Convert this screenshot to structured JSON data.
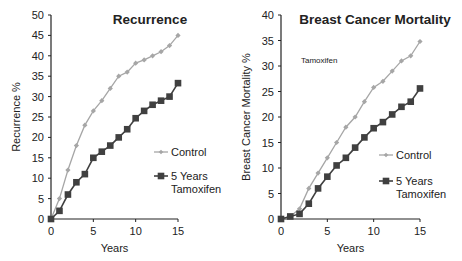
{
  "colors": {
    "control": "#a6a6a6",
    "tamoxifen": "#404040",
    "axis": "#222222"
  },
  "chart_data": [
    {
      "type": "line",
      "title": "Recurrence",
      "xlabel": "Years",
      "ylabel": "Recurrence %",
      "xlim": [
        0,
        15
      ],
      "ylim": [
        0,
        50
      ],
      "xticks": [
        0,
        5,
        10,
        15
      ],
      "yticks": [
        0,
        5,
        10,
        15,
        20,
        25,
        30,
        35,
        40,
        45,
        50
      ],
      "grid": false,
      "legend_position": "right",
      "x": [
        0,
        1,
        2,
        3,
        4,
        5,
        6,
        7,
        8,
        9,
        10,
        11,
        12,
        13,
        14,
        15
      ],
      "series": [
        {
          "name": "Control",
          "marker": "diamond",
          "values": [
            0,
            5,
            12,
            18,
            23,
            26.5,
            29,
            32,
            35,
            36,
            38.2,
            39,
            40,
            41,
            42.5,
            45
          ]
        },
        {
          "name": "5 Years Tamoxifen",
          "marker": "square",
          "values": [
            0,
            2,
            6,
            9,
            11,
            15,
            16.5,
            18,
            20,
            22,
            24.7,
            26.5,
            28,
            29,
            30,
            33.3
          ]
        }
      ]
    },
    {
      "type": "line",
      "title": "Breast Cancer Mortality",
      "annotation": "Tamoxifen",
      "xlabel": "Years",
      "ylabel": "Breast Cancer Mortality %",
      "xlim": [
        0,
        15
      ],
      "ylim": [
        0,
        40
      ],
      "xticks": [
        0,
        5,
        10,
        15
      ],
      "yticks": [
        0,
        5,
        10,
        15,
        20,
        25,
        30,
        35,
        40
      ],
      "grid": false,
      "legend_position": "right",
      "x": [
        0,
        1,
        2,
        3,
        4,
        5,
        6,
        7,
        8,
        9,
        10,
        11,
        12,
        13,
        14,
        15
      ],
      "series": [
        {
          "name": "Control",
          "marker": "diamond",
          "values": [
            0,
            0.5,
            2,
            6,
            9,
            12,
            15,
            18,
            20,
            23,
            25.8,
            27,
            29,
            31,
            32,
            34.8
          ]
        },
        {
          "name": "5 Years Tamoxifen",
          "marker": "square",
          "values": [
            0,
            0.5,
            1,
            3,
            6,
            8.3,
            10.5,
            12,
            14,
            16,
            17.8,
            19,
            20.5,
            22,
            23,
            25.6
          ]
        }
      ]
    }
  ],
  "legend": {
    "control_label": "Control",
    "tamoxifen_label_line1": "5 Years",
    "tamoxifen_label_line2": "Tamoxifen"
  }
}
